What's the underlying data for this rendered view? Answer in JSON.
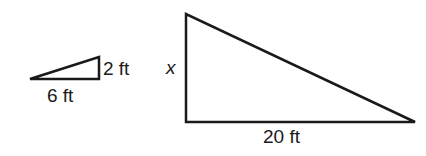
{
  "diagram": {
    "type": "similar-right-triangles",
    "stroke_color": "#1a1a1a",
    "small_triangle": {
      "base_label": "6 ft",
      "height_label": "2 ft"
    },
    "large_triangle": {
      "base_label": "20 ft",
      "height_label": "x"
    }
  }
}
